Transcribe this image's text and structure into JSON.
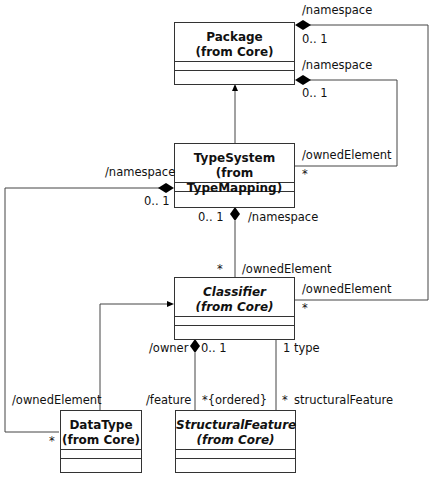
{
  "diagram": {
    "type": "UML class diagram",
    "classes": [
      {
        "id": "package",
        "name": "Package",
        "from": "(from Core)",
        "abstract": false
      },
      {
        "id": "typesystem",
        "name": "TypeSystem",
        "from": "(from TypeMapping)",
        "abstract": false
      },
      {
        "id": "classifier",
        "name": "Classifier",
        "from": "(from Core)",
        "abstract": true
      },
      {
        "id": "datatype",
        "name": "DataType",
        "from": "(from Core)",
        "abstract": false
      },
      {
        "id": "structuralfeature",
        "name": "StructuralFeature",
        "from": "(from Core)",
        "abstract": true
      }
    ],
    "labels": {
      "pkg_ns_top": "/namespace",
      "pkg_ns_top_mult": "0.. 1",
      "pkg_ns_mid": "/namespace",
      "pkg_ns_mid_mult": "0.. 1",
      "ts_owned": "/ownedElement",
      "ts_owned_mult": "*",
      "ts_ns_left": "/namespace",
      "ts_ns_left_mult": "0.. 1",
      "ts_ns_bottom_mult": "0.. 1",
      "ts_ns_bottom": "/namespace",
      "cls_owned_top_mult": "*",
      "cls_owned_top": "/ownedElement",
      "cls_owned_right": "/ownedElement",
      "cls_owned_right_mult": "*",
      "owner": "/owner",
      "owner_mult": "0.. 1",
      "type": "1 type",
      "dt_owned": "/ownedElement",
      "dt_owned_mult": "*",
      "feature": "/feature",
      "feature_mult": "*{ordered}",
      "sf_mult": "*",
      "sf_role": "structuralFeature"
    },
    "relationships": [
      {
        "kind": "generalization",
        "from": "typesystem",
        "to": "package"
      },
      {
        "kind": "generalization",
        "from": "datatype",
        "to": "classifier"
      },
      {
        "kind": "composition",
        "whole": "package",
        "part": "classifier",
        "whole_role": "/namespace",
        "whole_mult": "0.. 1",
        "part_role": "/ownedElement",
        "part_mult": "*"
      },
      {
        "kind": "composition",
        "whole": "package",
        "part": "typesystem",
        "whole_role": "/namespace",
        "whole_mult": "0.. 1",
        "part_role": "/ownedElement",
        "part_mult": "*"
      },
      {
        "kind": "composition",
        "whole": "typesystem",
        "part": "classifier",
        "whole_role": "/namespace",
        "whole_mult": "0.. 1",
        "part_role": "/ownedElement",
        "part_mult": "*"
      },
      {
        "kind": "composition",
        "whole": "typesystem",
        "part": "datatype",
        "whole_role": "/namespace",
        "whole_mult": "0.. 1",
        "part_role": "/ownedElement",
        "part_mult": "*"
      },
      {
        "kind": "composition",
        "whole": "classifier",
        "part": "structuralfeature",
        "whole_role": "/owner",
        "whole_mult": "0.. 1",
        "part_role": "/feature",
        "part_mult": "*{ordered}"
      },
      {
        "kind": "association",
        "from": "classifier",
        "to": "structuralfeature",
        "from_role": "type",
        "from_mult": "1",
        "to_role": "structuralFeature",
        "to_mult": "*"
      }
    ]
  }
}
